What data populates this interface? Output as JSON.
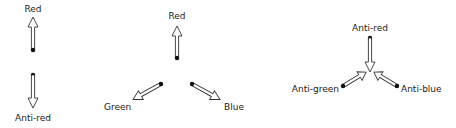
{
  "diagram": {
    "colors": {
      "stroke": "#333333",
      "dot": "#111111",
      "text": "#222222",
      "background": "#ffffff"
    },
    "panels": [
      {
        "name": "red-anti-red",
        "labels": {
          "red": "Red",
          "anti_red": "Anti-red"
        }
      },
      {
        "name": "three-colors",
        "labels": {
          "red": "Red",
          "green": "Green",
          "blue": "Blue"
        }
      },
      {
        "name": "three-anti-colors",
        "labels": {
          "anti_red": "Anti-red",
          "anti_green": "Anti-green",
          "anti_blue": "Anti-blue"
        }
      }
    ]
  }
}
